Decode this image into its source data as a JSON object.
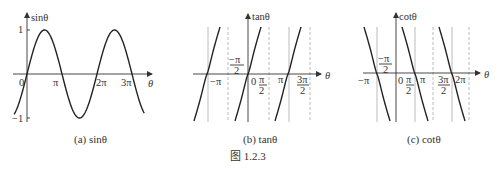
{
  "figure_caption": "图 1.2.3",
  "panels": [
    {
      "id": "sin",
      "caption": "(a) sinθ",
      "y_label": "sinθ",
      "x_label": "θ",
      "tick_labels": {
        "origin": "0",
        "pi": "π",
        "two_pi": "2π",
        "three_pi": "3π",
        "one": "1",
        "neg_one": "−1"
      }
    },
    {
      "id": "tan",
      "caption": "(b) tanθ",
      "y_label": "tanθ",
      "x_label": "θ",
      "tick_labels": {
        "neg_pi": "−π",
        "neg_half_pi_num": "−π",
        "half_den": "2",
        "origin": "0",
        "half_pi_num": "π",
        "pi": "π",
        "three_half_pi_num": "3π"
      }
    },
    {
      "id": "cot",
      "caption": "(c) cotθ",
      "y_label": "cotθ",
      "x_label": "θ",
      "tick_labels": {
        "neg_pi": "−π",
        "neg_half_pi_num": "−π",
        "half_den": "2",
        "origin": "0",
        "half_pi_num": "π",
        "pi": "π",
        "three_half_pi_num": "3π",
        "two_pi": "2π"
      }
    }
  ],
  "chart_data": [
    {
      "type": "line",
      "title": "(a) sinθ",
      "xlabel": "θ",
      "ylabel": "sinθ",
      "function": "sin",
      "x_range": [
        "-0.37π",
        "3.35π"
      ],
      "ylim": [
        -1,
        1
      ],
      "x_ticks": [
        "0",
        "π",
        "2π",
        "3π"
      ],
      "y_ticks": [
        "1",
        "-1"
      ],
      "grid": false
    },
    {
      "type": "line",
      "title": "(b) tanθ",
      "xlabel": "θ",
      "ylabel": "tanθ",
      "function": "tan",
      "branches_centered_at": [
        "-π",
        "0",
        "π"
      ],
      "solid_verticals_at": [
        "-π",
        "0",
        "π"
      ],
      "dashed_verticals_at": [
        "-π/2",
        "π/2",
        "3π/2"
      ],
      "x_ticks": [
        "-π",
        "-π/2",
        "0",
        "π/2",
        "π",
        "3π/2"
      ],
      "grid": false
    },
    {
      "type": "line",
      "title": "(c) cotθ",
      "xlabel": "θ",
      "ylabel": "cotθ",
      "function": "cot",
      "branches_centered_at": [
        "-π/2",
        "π/2",
        "3π/2"
      ],
      "x_ticks": [
        "-π",
        "-π/2",
        "0",
        "π/2",
        "π",
        "3π/2",
        "2π"
      ],
      "grid": false
    }
  ]
}
